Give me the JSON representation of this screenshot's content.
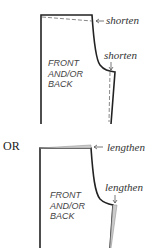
{
  "figure_top": {
    "piece_label": [
      "FRONT",
      "AND/OR",
      "BACK"
    ],
    "top_label": "shorten",
    "crotch_label": "shorten",
    "adjust_style": "dashed"
  },
  "separator": "OR",
  "figure_bottom": {
    "piece_label": [
      "FRONT",
      "AND/OR",
      "BACK"
    ],
    "top_label": "lengthen",
    "crotch_label": "lengthen",
    "adjust_style": "shaded"
  },
  "colors": {
    "outline": "#222222",
    "adjust_line": "#888888",
    "shade": "#cccccc",
    "text": "#333333"
  }
}
